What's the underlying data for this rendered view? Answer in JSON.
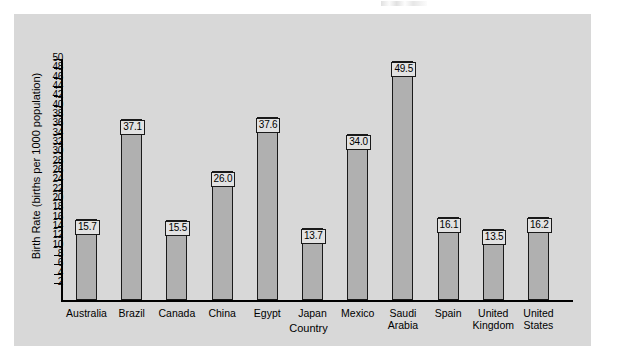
{
  "figure": {
    "background_color": "#ffffff",
    "panel_color": "#d8d8d8",
    "bar_fill_color": "#b0b0b0",
    "bar_border_color": "#1a1a1a",
    "value_box_fill_color": "#e2e2e2"
  },
  "chart_data": {
    "type": "bar",
    "title": "",
    "xlabel": "Country",
    "ylabel": "Birth Rate (births per 1000 population)",
    "categories": [
      "Australia",
      "Brazil",
      "Canada",
      "China",
      "Egypt",
      "Japan",
      "Mexico",
      "Saudi\nArabia",
      "Spain",
      "United\nKingdom",
      "United\nStates"
    ],
    "values": [
      15.7,
      37.1,
      15.5,
      26.0,
      37.6,
      13.7,
      34.0,
      49.5,
      16.1,
      13.5,
      16.2
    ],
    "value_labels": [
      "15.7",
      "37.1",
      "15.5",
      "26.0",
      "37.6",
      "13.7",
      "34.0",
      "49.5",
      "16.1",
      "13.5",
      "16.2"
    ],
    "ylim": [
      0,
      50
    ],
    "ytick_values": [
      50,
      48,
      46,
      44,
      42,
      40,
      38,
      36,
      34,
      32,
      30,
      28,
      26,
      24,
      22,
      20,
      18,
      16,
      14,
      12,
      10,
      8,
      6,
      4,
      2
    ],
    "ytick_labels": [
      "50",
      "48",
      "46",
      "44",
      "42",
      "40",
      "38",
      "36",
      "34",
      "32",
      "30",
      "28",
      "26",
      "24",
      "22",
      "20",
      "18",
      "16",
      "14",
      "12",
      "10",
      "8",
      "6",
      "4",
      "2"
    ],
    "ytick_step": 2,
    "grid": false,
    "legend": null,
    "legend_position": "none"
  }
}
